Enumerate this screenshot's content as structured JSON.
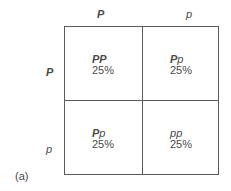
{
  "columns": [
    {
      "allele": "P",
      "bold": true
    },
    {
      "allele": "p",
      "bold": false
    }
  ],
  "rows": [
    {
      "allele": "P",
      "bold": true
    },
    {
      "allele": "p",
      "bold": false
    }
  ],
  "cells": [
    {
      "g1": "P",
      "g2": "P",
      "percent": "25%"
    },
    {
      "g1": "P",
      "g2": "p",
      "percent": "25%"
    },
    {
      "g1": "P",
      "g2": "p",
      "percent": "25%"
    },
    {
      "g1": "p",
      "g2": "p",
      "percent": "25%"
    }
  ],
  "panel_label": "(a)"
}
